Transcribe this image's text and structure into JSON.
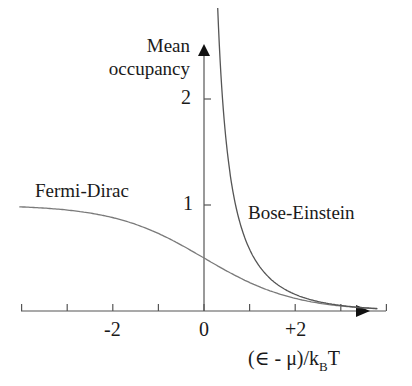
{
  "chart_data": {
    "type": "line",
    "title": "",
    "xlabel": "(∈ -  μ)/k_B T",
    "ylabel": "Mean occupancy",
    "xlim": [
      -4.1,
      4.0
    ],
    "ylim": [
      0,
      2.5
    ],
    "x_ticks": [
      -4,
      -3,
      -2,
      -1,
      0,
      1,
      2,
      3,
      4
    ],
    "x_tick_labels": [
      {
        "value": -2,
        "label": "-2"
      },
      {
        "value": 0,
        "label": "0"
      },
      {
        "value": 2,
        "label": "+2"
      }
    ],
    "y_tick_labels": [
      {
        "value": 1,
        "label": "1"
      },
      {
        "value": 2,
        "label": "2"
      }
    ],
    "grid": false,
    "series": [
      {
        "name": "Fermi-Dirac",
        "formula": "1/(exp(x)+1)",
        "x": [
          -4,
          -3,
          -2,
          -1,
          0,
          1,
          2,
          3,
          3.6
        ],
        "values": [
          0.982,
          0.953,
          0.881,
          0.731,
          0.5,
          0.269,
          0.119,
          0.047,
          0.027
        ],
        "color": "#7a7a7a"
      },
      {
        "name": "Bose-Einstein",
        "formula": "1/(exp(x)-1)",
        "x": [
          0.35,
          0.5,
          0.75,
          1,
          1.5,
          2,
          2.5,
          3,
          3.6
        ],
        "values": [
          2.38,
          1.54,
          0.895,
          0.582,
          0.287,
          0.157,
          0.089,
          0.052,
          0.028
        ],
        "color": "#555555"
      }
    ],
    "annotations": [
      {
        "text": "Fermi-Dirac",
        "near_x": -3.2,
        "near_y": 1.15
      },
      {
        "text": "Bose-Einstein",
        "near_x": 1.7,
        "near_y": 0.9
      }
    ]
  },
  "labels": {
    "ylabel_line1": "Mean",
    "ylabel_line2": "occupancy",
    "ytick_2": "2",
    "ytick_1": "1",
    "xtick_m2": "-2",
    "xtick_0": "0",
    "xtick_p2": "+2",
    "fd_label": "Fermi-Dirac",
    "be_label": "Bose-Einstein",
    "xlabel_main": "(∈ -  μ)/k",
    "xlabel_sub": "B",
    "xlabel_tail": "T"
  }
}
